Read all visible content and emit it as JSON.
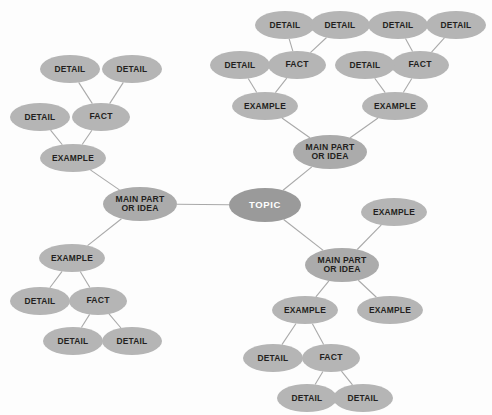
{
  "diagram": {
    "background_color": "#fdfdfd",
    "node_color": "#b5b5b5",
    "topic_color": "#9a9a9a",
    "topic_text_color": "#ffffff",
    "node_text_color": "#231f20",
    "edge_color": "#a9a9a9"
  },
  "labels": {
    "topic": "TOPIC",
    "main": "MAIN PART\nOR IDEA",
    "example": "EXAMPLE",
    "fact": "FACT",
    "detail": "DETAIL"
  },
  "nodes": [
    {
      "id": "topic",
      "label": "TOPIC",
      "kind": "topic",
      "x": 265,
      "y": 205,
      "w": 72,
      "h": 34
    },
    {
      "id": "main-left",
      "label": "MAIN PART\nOR IDEA",
      "kind": "main",
      "x": 140,
      "y": 204,
      "w": 74,
      "h": 34
    },
    {
      "id": "main-top",
      "label": "MAIN PART\nOR IDEA",
      "kind": "main",
      "x": 330,
      "y": 152,
      "w": 74,
      "h": 34
    },
    {
      "id": "main-bot",
      "label": "MAIN PART\nOR IDEA",
      "kind": "main",
      "x": 342,
      "y": 265,
      "w": 74,
      "h": 34
    },
    {
      "id": "ex-tl",
      "label": "EXAMPLE",
      "kind": "example",
      "x": 73,
      "y": 158,
      "w": 66,
      "h": 28
    },
    {
      "id": "fact-tl",
      "label": "FACT",
      "kind": "fact",
      "x": 101,
      "y": 117,
      "w": 58,
      "h": 28
    },
    {
      "id": "det-tl-1",
      "label": "DETAIL",
      "kind": "detail",
      "x": 40,
      "y": 117,
      "w": 60,
      "h": 28
    },
    {
      "id": "det-tl-2",
      "label": "DETAIL",
      "kind": "detail",
      "x": 70,
      "y": 69,
      "w": 60,
      "h": 28
    },
    {
      "id": "det-tl-3",
      "label": "DETAIL",
      "kind": "detail",
      "x": 132,
      "y": 69,
      "w": 60,
      "h": 28
    },
    {
      "id": "ex-bl",
      "label": "EXAMPLE",
      "kind": "example",
      "x": 72,
      "y": 258,
      "w": 66,
      "h": 28
    },
    {
      "id": "fact-bl",
      "label": "FACT",
      "kind": "fact",
      "x": 98,
      "y": 301,
      "w": 58,
      "h": 28
    },
    {
      "id": "det-bl-1",
      "label": "DETAIL",
      "kind": "detail",
      "x": 40,
      "y": 301,
      "w": 60,
      "h": 28
    },
    {
      "id": "det-bl-2",
      "label": "DETAIL",
      "kind": "detail",
      "x": 73,
      "y": 341,
      "w": 60,
      "h": 28
    },
    {
      "id": "det-bl-3",
      "label": "DETAIL",
      "kind": "detail",
      "x": 132,
      "y": 341,
      "w": 60,
      "h": 28
    },
    {
      "id": "ex-tr-a",
      "label": "EXAMPLE",
      "kind": "example",
      "x": 265,
      "y": 106,
      "w": 66,
      "h": 28
    },
    {
      "id": "fact-tr-a",
      "label": "FACT",
      "kind": "fact",
      "x": 297,
      "y": 65,
      "w": 58,
      "h": 28
    },
    {
      "id": "det-tr-a1",
      "label": "DETAIL",
      "kind": "detail",
      "x": 240,
      "y": 65,
      "w": 60,
      "h": 28
    },
    {
      "id": "det-tr-a2",
      "label": "DETAIL",
      "kind": "detail",
      "x": 285,
      "y": 25,
      "w": 60,
      "h": 28
    },
    {
      "id": "det-tr-a3",
      "label": "DETAIL",
      "kind": "detail",
      "x": 340,
      "y": 25,
      "w": 60,
      "h": 28
    },
    {
      "id": "ex-tr-b",
      "label": "EXAMPLE",
      "kind": "example",
      "x": 395,
      "y": 106,
      "w": 66,
      "h": 28
    },
    {
      "id": "fact-tr-b",
      "label": "FACT",
      "kind": "fact",
      "x": 420,
      "y": 65,
      "w": 58,
      "h": 28
    },
    {
      "id": "det-tr-b1",
      "label": "DETAIL",
      "kind": "detail",
      "x": 365,
      "y": 65,
      "w": 60,
      "h": 28
    },
    {
      "id": "det-tr-b2",
      "label": "DETAIL",
      "kind": "detail",
      "x": 398,
      "y": 25,
      "w": 60,
      "h": 28
    },
    {
      "id": "det-tr-b3",
      "label": "DETAIL",
      "kind": "detail",
      "x": 456,
      "y": 25,
      "w": 60,
      "h": 28
    },
    {
      "id": "ex-mid-r",
      "label": "EXAMPLE",
      "kind": "example",
      "x": 394,
      "y": 212,
      "w": 66,
      "h": 28
    },
    {
      "id": "ex-br-a",
      "label": "EXAMPLE",
      "kind": "example",
      "x": 305,
      "y": 310,
      "w": 66,
      "h": 28
    },
    {
      "id": "ex-br-b",
      "label": "EXAMPLE",
      "kind": "example",
      "x": 390,
      "y": 310,
      "w": 66,
      "h": 28
    },
    {
      "id": "fact-br",
      "label": "FACT",
      "kind": "fact",
      "x": 331,
      "y": 358,
      "w": 58,
      "h": 28
    },
    {
      "id": "det-br-1",
      "label": "DETAIL",
      "kind": "detail",
      "x": 273,
      "y": 358,
      "w": 60,
      "h": 28
    },
    {
      "id": "det-br-2",
      "label": "DETAIL",
      "kind": "detail",
      "x": 307,
      "y": 398,
      "w": 60,
      "h": 28
    },
    {
      "id": "det-br-3",
      "label": "DETAIL",
      "kind": "detail",
      "x": 363,
      "y": 398,
      "w": 60,
      "h": 28
    }
  ],
  "edges": [
    [
      "topic",
      "main-left"
    ],
    [
      "topic",
      "main-top"
    ],
    [
      "topic",
      "main-bot"
    ],
    [
      "main-left",
      "ex-tl"
    ],
    [
      "ex-tl",
      "fact-tl"
    ],
    [
      "ex-tl",
      "det-tl-1"
    ],
    [
      "fact-tl",
      "det-tl-2"
    ],
    [
      "fact-tl",
      "det-tl-3"
    ],
    [
      "main-left",
      "ex-bl"
    ],
    [
      "ex-bl",
      "fact-bl"
    ],
    [
      "ex-bl",
      "det-bl-1"
    ],
    [
      "fact-bl",
      "det-bl-2"
    ],
    [
      "fact-bl",
      "det-bl-3"
    ],
    [
      "main-top",
      "ex-tr-a"
    ],
    [
      "ex-tr-a",
      "fact-tr-a"
    ],
    [
      "ex-tr-a",
      "det-tr-a1"
    ],
    [
      "fact-tr-a",
      "det-tr-a2"
    ],
    [
      "fact-tr-a",
      "det-tr-a3"
    ],
    [
      "main-top",
      "ex-tr-b"
    ],
    [
      "ex-tr-b",
      "fact-tr-b"
    ],
    [
      "ex-tr-b",
      "det-tr-b1"
    ],
    [
      "fact-tr-b",
      "det-tr-b2"
    ],
    [
      "fact-tr-b",
      "det-tr-b3"
    ],
    [
      "main-bot",
      "ex-mid-r"
    ],
    [
      "main-bot",
      "ex-br-a"
    ],
    [
      "main-bot",
      "ex-br-b"
    ],
    [
      "ex-br-a",
      "fact-br"
    ],
    [
      "ex-br-a",
      "det-br-1"
    ],
    [
      "fact-br",
      "det-br-2"
    ],
    [
      "fact-br",
      "det-br-3"
    ]
  ]
}
